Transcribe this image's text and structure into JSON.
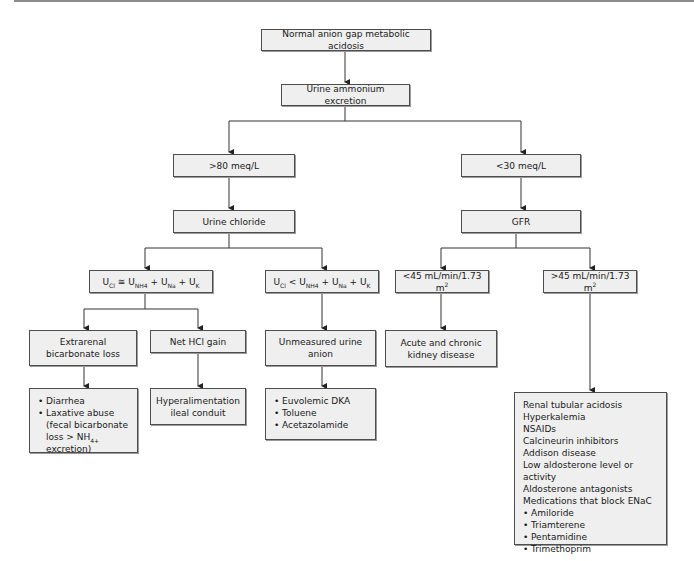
{
  "title": "Normal anion gap metabolic acidosis",
  "nodes": {
    "root": "Normal anion gap metabolic acidosis",
    "urine_ammonium": "Urine ammonium excretion",
    "high_ammonium": ">80 meq/L",
    "low_ammonium": "<30 meq/L",
    "urine_chloride": "Urine chloride",
    "gfr": "GFR",
    "ucl_equal": {
      "u1": "U",
      "s1": "Cl",
      "op": " ≅ U",
      "s2": "NH4",
      "p1": " + U",
      "s3": "Na",
      "p2": " + U",
      "s4": "K"
    },
    "ucl_less": {
      "u1": "U",
      "s1": "Cl",
      "op": " < U",
      "s2": "NH4",
      "p1": " + U",
      "s3": "Na",
      "p2": " + U",
      "s4": "K"
    },
    "gfr_low": {
      "text": "<45 mL/min/1.73 m",
      "sup": "2"
    },
    "gfr_high": {
      "text": ">45 mL/min/1.73 m",
      "sup": "2"
    },
    "extrarenal": "Extrarenal bicarbonate loss",
    "net_hcl": "Net HCl gain",
    "unmeasured": "Unmeasured urine anion",
    "ckd": "Acute and chronic kidney disease",
    "extrarenal_causes": {
      "items": [
        "Diarrhea",
        "Laxative abuse (fecal bicarbonate loss > NH"
      ],
      "sub": "4+",
      "tail": " excretion)"
    },
    "net_hcl_causes": "Hyperalimentation ileal conduit",
    "unmeasured_causes": [
      "Euvolemic DKA",
      "Toluene",
      "Acetazolamide"
    ],
    "gfr_high_causes": {
      "plain": [
        "Renal tubular acidosis",
        "Hyperkalemia",
        "NSAIDs",
        "Calcineurin inhibitors",
        "Addison disease",
        "Low aldosterone level or activity",
        "Aldosterone antagonists",
        "Medications that block ENaC"
      ],
      "bullets": [
        "Amiloride",
        "Triamterene",
        "Pentamidine",
        "Trimethoprim"
      ]
    }
  },
  "colors": {
    "box_fill": "#efefef",
    "box_border": "#4d4d4d",
    "line": "#333333"
  }
}
